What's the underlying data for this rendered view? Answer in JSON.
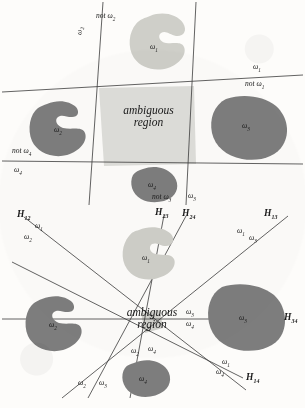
{
  "figure": {
    "background_color": "#fdfcfa",
    "line_color": "#3b3b3b",
    "blob_light_color": "#cfcfc9",
    "blob_dark_color": "#7d7d7d",
    "ambiguous_fill_color": "#dededa",
    "text_color": "#1a1a1a"
  },
  "top_panel": {
    "ambiguous_label_line1": "ambiguous",
    "ambiguous_label_line2": "region",
    "blobs": [
      {
        "name": "omega-1",
        "label": "ω",
        "sub": "1",
        "shade": "light"
      },
      {
        "name": "omega-2",
        "label": "ω",
        "sub": "2",
        "shade": "dark"
      },
      {
        "name": "omega-3",
        "label": "ω",
        "sub": "3",
        "shade": "dark"
      },
      {
        "name": "omega-4",
        "label": "ω",
        "sub": "4",
        "shade": "dark"
      }
    ],
    "boundary_labels": [
      {
        "name": "omega-2-left",
        "text": "ω",
        "sub": "2",
        "prefix": ""
      },
      {
        "name": "not-omega-2",
        "text": "not ω",
        "sub": "2",
        "prefix": "not"
      },
      {
        "name": "omega-1-right",
        "text": "ω",
        "sub": "1",
        "prefix": ""
      },
      {
        "name": "not-omega-1",
        "text": "not ω",
        "sub": "1",
        "prefix": "not"
      },
      {
        "name": "not-omega-4",
        "text": "not ω",
        "sub": "4",
        "prefix": "not"
      },
      {
        "name": "omega-4-left",
        "text": "ω",
        "sub": "4",
        "prefix": ""
      },
      {
        "name": "not-omega-3",
        "text": "not ω",
        "sub": "3",
        "prefix": "not"
      },
      {
        "name": "omega-3-bottom",
        "text": "ω",
        "sub": "3",
        "prefix": ""
      }
    ]
  },
  "bottom_panel": {
    "ambiguous_label_line1": "ambiguous",
    "ambiguous_label_line2": "region",
    "blobs": [
      {
        "name": "omega-1",
        "label": "ω",
        "sub": "1",
        "shade": "light"
      },
      {
        "name": "omega-2",
        "label": "ω",
        "sub": "2",
        "shade": "dark"
      },
      {
        "name": "omega-3",
        "label": "ω",
        "sub": "3",
        "shade": "dark"
      },
      {
        "name": "omega-4",
        "label": "ω",
        "sub": "4",
        "shade": "dark"
      }
    ],
    "hyperplanes": [
      {
        "name": "H12",
        "label": "H",
        "sub": "12"
      },
      {
        "name": "H23",
        "label": "H",
        "sub": "23"
      },
      {
        "name": "H24",
        "label": "H",
        "sub": "24"
      },
      {
        "name": "H13",
        "label": "H",
        "sub": "13"
      },
      {
        "name": "H34",
        "label": "H",
        "sub": "34"
      },
      {
        "name": "H14",
        "label": "H",
        "sub": "14"
      }
    ],
    "side_labels": [
      {
        "name": "H12-omega-1",
        "text": "ω",
        "sub": "1"
      },
      {
        "name": "H12-omega-2",
        "text": "ω",
        "sub": "2"
      },
      {
        "name": "H13-omega-1",
        "text": "ω",
        "sub": "1"
      },
      {
        "name": "H13-omega-3",
        "text": "ω",
        "sub": "3"
      },
      {
        "name": "H34-omega-3",
        "text": "ω",
        "sub": "3"
      },
      {
        "name": "H34-omega-4",
        "text": "ω",
        "sub": "4"
      },
      {
        "name": "H14-omega-1",
        "text": "ω",
        "sub": "1"
      },
      {
        "name": "H14-omega-4",
        "text": "ω",
        "sub": "4"
      },
      {
        "name": "H23-omega-2",
        "text": "ω",
        "sub": "2"
      },
      {
        "name": "H23-omega-3",
        "text": "ω",
        "sub": "3"
      },
      {
        "name": "H24-omega-2",
        "text": "ω",
        "sub": "2"
      },
      {
        "name": "H24-omega-4",
        "text": "ω",
        "sub": "4"
      }
    ]
  }
}
